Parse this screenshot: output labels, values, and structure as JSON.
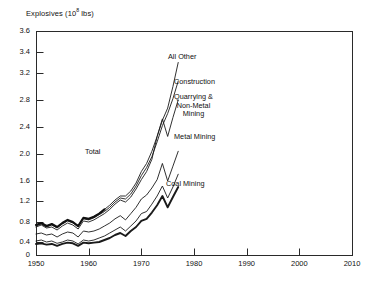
{
  "chart_data": {
    "type": "line",
    "title": "",
    "ylabel": "Explosives (10⁸ lbs)",
    "ylabel_base": "Explosives (10",
    "ylabel_exp": "8",
    "ylabel_tail": " lbs)",
    "xlabel": "",
    "xlim": [
      1950,
      2010
    ],
    "ylim": [
      0,
      3.6
    ],
    "grid": false,
    "legend_position": "inline-annotations",
    "ytick_labels": [
      "3.6",
      "3.4",
      "3.2",
      "2.8",
      "2.4",
      "2.0",
      "1.6",
      "1.2",
      "0.8",
      "0.4",
      "0"
    ],
    "ytick_values": [
      3.6,
      3.4,
      3.2,
      2.8,
      2.4,
      2.0,
      1.6,
      1.2,
      0.8,
      0.4,
      0
    ],
    "xtick_labels": [
      "1950",
      "1960",
      "1970",
      "1980",
      "1990",
      "2000",
      "2010"
    ],
    "xtick_values": [
      1950,
      1960,
      1970,
      1980,
      1990,
      2000,
      2010
    ],
    "x": [
      1950,
      1951,
      1952,
      1953,
      1954,
      1955,
      1956,
      1957,
      1958,
      1959,
      1960,
      1961,
      1962,
      1963,
      1964,
      1965,
      1966,
      1967,
      1968,
      1969,
      1970,
      1971,
      1972,
      1973,
      1974,
      1975,
      1976,
      1977
    ],
    "series": [
      {
        "name": "All Other",
        "label": "All Other",
        "label_x": 168,
        "label_y": 53,
        "align": "left",
        "width": 0.9,
        "values": [
          0.74,
          0.78,
          0.72,
          0.76,
          0.7,
          0.78,
          0.84,
          0.8,
          0.72,
          0.88,
          0.86,
          0.9,
          0.96,
          1.04,
          1.12,
          1.22,
          1.3,
          1.3,
          1.4,
          1.56,
          1.74,
          1.86,
          2.04,
          2.26,
          2.5,
          2.68,
          3.0,
          3.3
        ]
      },
      {
        "name": "Construction",
        "label": "Construction",
        "label_x": 174,
        "label_y": 78,
        "align": "left",
        "width": 0.9,
        "values": [
          0.72,
          0.76,
          0.7,
          0.74,
          0.68,
          0.76,
          0.82,
          0.78,
          0.7,
          0.86,
          0.84,
          0.88,
          0.94,
          1.0,
          1.08,
          1.18,
          1.26,
          1.24,
          1.34,
          1.5,
          1.68,
          1.8,
          1.96,
          2.18,
          2.42,
          2.6,
          2.82,
          3.08
        ]
      },
      {
        "name": "Quarrying & Non-Metal Mining",
        "label": "Quarrying &",
        "label_line2": "Non-Metal",
        "label_line3": "Mining",
        "label_x": 174,
        "label_y": 93,
        "align": "left",
        "width": 0.9,
        "values": [
          0.7,
          0.74,
          0.68,
          0.7,
          0.64,
          0.72,
          0.78,
          0.74,
          0.66,
          0.82,
          0.8,
          0.84,
          0.9,
          0.96,
          1.04,
          1.14,
          1.22,
          1.18,
          1.28,
          1.44,
          1.62,
          1.74,
          1.92,
          2.26,
          2.52,
          2.26,
          2.54,
          2.8
        ]
      },
      {
        "name": "Metal Mining",
        "label": "Metal Mining",
        "label_x": 174,
        "label_y": 133,
        "align": "left",
        "width": 0.9,
        "values": [
          0.56,
          0.58,
          0.54,
          0.56,
          0.5,
          0.56,
          0.6,
          0.58,
          0.5,
          0.62,
          0.6,
          0.62,
          0.66,
          0.72,
          0.78,
          0.86,
          0.92,
          0.84,
          0.96,
          1.08,
          1.24,
          1.32,
          1.46,
          1.62,
          1.86,
          1.6,
          1.82,
          2.04
        ]
      },
      {
        "name": "Coal Mining",
        "label": "Coal Mining",
        "label_x": 166,
        "label_y": 180,
        "align": "left",
        "width": 0.9,
        "values": [
          0.42,
          0.44,
          0.4,
          0.42,
          0.36,
          0.4,
          0.44,
          0.42,
          0.34,
          0.44,
          0.42,
          0.44,
          0.48,
          0.52,
          0.58,
          0.64,
          0.7,
          0.62,
          0.72,
          0.82,
          0.96,
          1.0,
          1.14,
          1.3,
          1.5,
          1.26,
          1.48,
          1.7
        ]
      },
      {
        "name": "Total",
        "label": "Total",
        "label_x": 85,
        "label_y": 148,
        "align": "left",
        "width": 1.9,
        "values": [
          0.34,
          0.36,
          0.32,
          0.34,
          0.28,
          0.34,
          0.38,
          0.36,
          0.28,
          0.38,
          0.36,
          0.38,
          0.4,
          0.44,
          0.48,
          0.54,
          0.58,
          0.52,
          0.62,
          0.7,
          0.82,
          0.86,
          0.98,
          1.12,
          1.3,
          1.08,
          1.28,
          1.48
        ]
      }
    ],
    "series_thick_overlay": {
      "name": "Total",
      "values": [
        0.74,
        0.78,
        0.72,
        0.76,
        0.7,
        0.78,
        0.84,
        0.8,
        0.72,
        0.88,
        0.86,
        0.9,
        0.96,
        1.04,
        1.12,
        1.22,
        1.3,
        1.3,
        1.4,
        1.56,
        1.74,
        1.86,
        2.04,
        2.26,
        2.5,
        2.68,
        3.0,
        3.3
      ]
    }
  },
  "plot": {
    "left": 36,
    "right": 352,
    "top": 31,
    "bottom": 255,
    "frame_color": "#2a2a2a"
  }
}
